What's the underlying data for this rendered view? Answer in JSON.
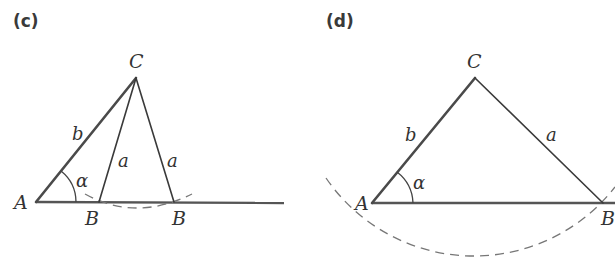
{
  "figure": {
    "panels": [
      {
        "id": "c",
        "label": "(c)",
        "vertices": {
          "A": "A",
          "B1": "B",
          "B2": "B",
          "C": "C"
        },
        "sides": {
          "b": "b",
          "a1": "a",
          "a2": "a"
        },
        "angle": "α",
        "description": "Ambiguous case: two triangles with same side a from C intersecting baseline at two points B"
      },
      {
        "id": "d",
        "label": "(d)",
        "vertices": {
          "A": "A",
          "B": "B",
          "C": "C"
        },
        "sides": {
          "b": "b",
          "a": "a"
        },
        "angle": "α",
        "description": "Single triangle: circle of radius a from C meets baseline at one point B"
      }
    ],
    "colors": {
      "stroke": "#3a3a3a",
      "dashed_arc": "#777777",
      "text": "#333333",
      "background": "#ffffff"
    }
  }
}
